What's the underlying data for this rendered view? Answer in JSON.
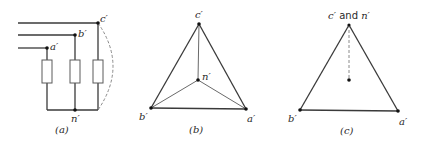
{
  "figure": {
    "panels": [
      {
        "id": "a",
        "caption": "(a)",
        "description": "Three-phase Y-connected load with lines a', b', c' and neutral n'",
        "labels": {
          "a": "a′",
          "b": "b′",
          "c": "c′",
          "n": "n′"
        }
      },
      {
        "id": "b",
        "caption": "(b)",
        "description": "Voltage triangle with neutral point n' inside",
        "labels": {
          "a": "a′",
          "b": "b′",
          "c": "c′",
          "n": "n′"
        }
      },
      {
        "id": "c",
        "caption": "(c)",
        "description": "Voltage triangle with neutral point shifted to vertex c'",
        "labels": {
          "a": "a′",
          "b": "b′",
          "c_and_n_prefix": "c′",
          "c_and_n_joiner": " and ",
          "c_and_n_suffix": "n′"
        }
      }
    ],
    "colors": {
      "ink": "#2a2a2a",
      "background": "#ffffff"
    }
  }
}
